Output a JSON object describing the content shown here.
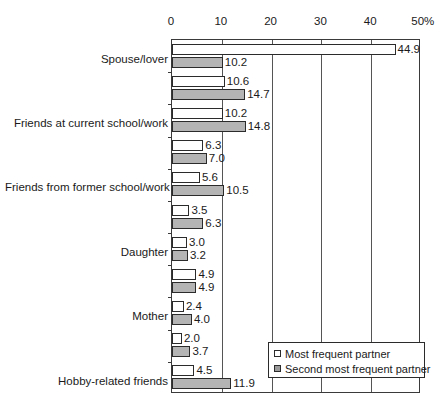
{
  "chart_data": {
    "type": "bar",
    "orientation": "horizontal",
    "title": "",
    "subtitle": "",
    "xlabel": "",
    "ylabel": "",
    "xlim": [
      0,
      50
    ],
    "grid": true,
    "grid_axis": "x",
    "legend_position": "bottom-right",
    "xticks": [
      {
        "value": 0,
        "label": "0"
      },
      {
        "value": 10,
        "label": "10"
      },
      {
        "value": 20,
        "label": "20"
      },
      {
        "value": 30,
        "label": "30"
      },
      {
        "value": 40,
        "label": "40"
      },
      {
        "value": 50,
        "label": "50%"
      }
    ],
    "categories": [
      "Spouse/lover",
      "Friends at current school/work",
      "Friends from former school/work",
      "Daughter",
      "Mother",
      "Hobby-related friends",
      "Father",
      "Son",
      "Friends in the neighborhood",
      "Sister",
      "Other"
    ],
    "series": [
      {
        "name": "Most frequent partner",
        "color": "#ffffff",
        "values": [
          44.9,
          10.6,
          10.2,
          6.3,
          5.6,
          3.5,
          3.0,
          4.9,
          2.4,
          2.0,
          4.5
        ],
        "labels": [
          "44.9",
          "10.6",
          "10.2",
          "6.3",
          "5.6",
          "3.5",
          "3.0",
          "4.9",
          "2.4",
          "2.0",
          "4.5"
        ]
      },
      {
        "name": "Second most frequent partner",
        "color": "#b4b4b4",
        "values": [
          10.2,
          14.7,
          14.8,
          7.0,
          10.5,
          6.3,
          3.2,
          4.9,
          4.0,
          3.7,
          11.9
        ],
        "labels": [
          "10.2",
          "14.7",
          "14.8",
          "7.0",
          "10.5",
          "6.3",
          "3.2",
          "4.9",
          "4.0",
          "3.7",
          "11.9"
        ]
      }
    ]
  },
  "legend": {
    "items": [
      {
        "label": "Most frequent partner",
        "swatch": "white-square-icon"
      },
      {
        "label": "Second most frequent partner",
        "swatch": "gray-square-icon"
      }
    ]
  }
}
